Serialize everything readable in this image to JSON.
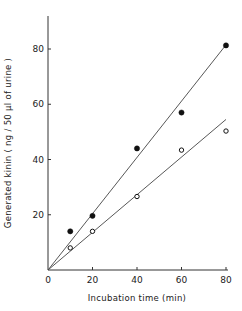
{
  "chart_data": {
    "type": "scatter",
    "title": "",
    "xlabel": "Incubation time  (min)",
    "ylabel": "Generated kinin   ( ng / 50 µl of urine )",
    "xlim": [
      0,
      80
    ],
    "ylim": [
      0,
      92
    ],
    "x_ticks": [
      0,
      20,
      40,
      60,
      80
    ],
    "x_tick_labels": [
      "0",
      "20",
      "40",
      "60",
      "80"
    ],
    "y_ticks": [
      20,
      40,
      60,
      80
    ],
    "y_tick_labels": [
      "20",
      "40",
      "60",
      "80"
    ],
    "grid": false,
    "legend": null,
    "series": [
      {
        "name": "filled circles",
        "marker": "filled-circle",
        "x": [
          10,
          20,
          40,
          60,
          80
        ],
        "y": [
          14,
          19.6,
          44,
          57,
          81.3
        ],
        "fit_line": {
          "x": [
            0,
            80
          ],
          "y": [
            0,
            81.5
          ]
        }
      },
      {
        "name": "open circles",
        "marker": "open-circle",
        "x": [
          10,
          20,
          40,
          60,
          80
        ],
        "y": [
          8,
          14,
          26.6,
          43.4,
          50.3
        ],
        "fit_line": {
          "x": [
            0,
            80
          ],
          "y": [
            0,
            54.5
          ]
        }
      }
    ]
  }
}
